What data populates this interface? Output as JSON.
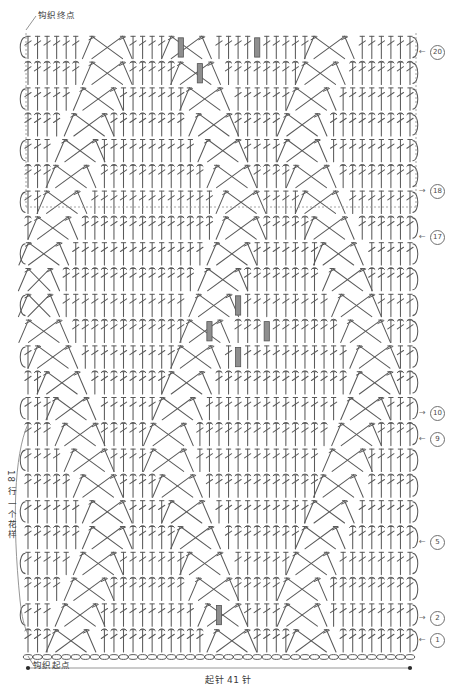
{
  "document": {
    "type": "crochet-stitch-chart",
    "title_end_marker": "钩织终点",
    "title_start_marker": "钩织起点",
    "cast_on_label": "起针 41 针",
    "repeat_label": "18 行 一个花样"
  },
  "colors": {
    "stroke": "#5a5a5a",
    "stroke_dark": "#3f3f3f",
    "bobble_fill": "#8e8e8e",
    "bobble_stroke": "#555555",
    "background": "#ffffff",
    "dash_line": "#9a9a9a",
    "measure_line": "#8a8a8a"
  },
  "row_markers": [
    {
      "id": "r20",
      "number": "20",
      "y": 51,
      "direction": "left"
    },
    {
      "id": "r18",
      "number": "18",
      "y": 190,
      "direction": "right"
    },
    {
      "id": "r17",
      "number": "17",
      "y": 236,
      "direction": "left"
    },
    {
      "id": "r10",
      "number": "10",
      "y": 412,
      "direction": "right"
    },
    {
      "id": "r9",
      "number": "9",
      "y": 438,
      "direction": "left"
    },
    {
      "id": "r5",
      "number": "5",
      "y": 541,
      "direction": "left"
    },
    {
      "id": "r2",
      "number": "2",
      "y": 617,
      "direction": "right"
    },
    {
      "id": "r1",
      "number": "1",
      "y": 639,
      "direction": "left"
    }
  ],
  "chart_geometry": {
    "left": 28,
    "right": 410,
    "stitch_count": 41,
    "row_top": 33,
    "row_bottom": 652,
    "row_height": 25.8,
    "total_rows": 24,
    "dashed_divider_y": 207,
    "foundation_chain_y": 657
  },
  "legend_symbols": [
    {
      "name": "double-crochet",
      "desc": "长针"
    },
    {
      "name": "chain-stitch",
      "desc": "锁针"
    },
    {
      "name": "crossed-stitch",
      "desc": "交叉长针"
    },
    {
      "name": "puff-stitch",
      "desc": "枣形针"
    }
  ],
  "measure": {
    "cast_on_text": "起针 41 针",
    "left_dot_x": 28,
    "right_dot_x": 410,
    "line_y": 668
  }
}
